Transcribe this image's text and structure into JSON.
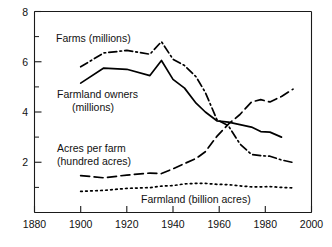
{
  "chart_data": {
    "type": "line",
    "title": "",
    "subtitle": "",
    "xlabel": "",
    "ylabel": "",
    "xlim": [
      1880,
      2000
    ],
    "ylim": [
      0,
      8
    ],
    "grid": false,
    "legend_position": "inline-annotations",
    "x_ticks": [
      1880,
      1900,
      1920,
      1940,
      1960,
      1980,
      2000
    ],
    "x_tick_labels": [
      "1880",
      "1900",
      "1920",
      "1940",
      "1960",
      "1980",
      "2000"
    ],
    "y_ticks": [
      2,
      4,
      6,
      8
    ],
    "y_tick_labels": [
      "2",
      "4",
      "6",
      "8"
    ],
    "y_minor_ticks": [
      1,
      3,
      5,
      7
    ],
    "series": [
      {
        "name": "Farms (millions)",
        "style": "dash-dot",
        "label_text": "Farms (millions)",
        "label_lines": [
          "Farms (millions)"
        ],
        "x": [
          1900,
          1910,
          1920,
          1930,
          1935,
          1940,
          1945,
          1950,
          1954,
          1959,
          1964,
          1969,
          1974,
          1978,
          1982,
          1987,
          1992
        ],
        "values": [
          5.8,
          6.35,
          6.45,
          6.3,
          6.8,
          6.1,
          5.85,
          5.4,
          4.78,
          3.7,
          3.45,
          2.73,
          2.31,
          2.26,
          2.24,
          2.09,
          1.99
        ]
      },
      {
        "name": "Farmland owners (millions)",
        "style": "solid",
        "label_text": "Farmland owners (millions)",
        "label_lines": [
          "Farmland owners",
          "(millions)"
        ],
        "x": [
          1900,
          1910,
          1920,
          1930,
          1935,
          1940,
          1945,
          1950,
          1954,
          1959,
          1964,
          1969,
          1974,
          1978,
          1982,
          1987
        ],
        "values": [
          5.15,
          5.75,
          5.7,
          5.45,
          6.05,
          5.3,
          4.95,
          4.35,
          4.0,
          3.65,
          3.6,
          3.5,
          3.4,
          3.22,
          3.2,
          3.0
        ]
      },
      {
        "name": "Acres per farm (hundred acres)",
        "style": "long-dash",
        "label_text": "Acres per farm (hundred acres)",
        "label_lines": [
          "Acres per farm",
          "(hundred acres)"
        ],
        "x": [
          1900,
          1910,
          1920,
          1930,
          1935,
          1940,
          1945,
          1950,
          1954,
          1959,
          1964,
          1969,
          1974,
          1978,
          1982,
          1987,
          1992
        ],
        "values": [
          1.47,
          1.38,
          1.49,
          1.57,
          1.55,
          1.74,
          1.95,
          2.15,
          2.42,
          3.03,
          3.52,
          3.9,
          4.4,
          4.49,
          4.4,
          4.62,
          4.91
        ]
      },
      {
        "name": "Farmland (billion acres)",
        "style": "dotted",
        "label_text": "Farmland (billion acres)",
        "label_lines": [
          "Farmland (billion acres)"
        ],
        "x": [
          1900,
          1910,
          1920,
          1930,
          1935,
          1940,
          1945,
          1950,
          1954,
          1959,
          1964,
          1969,
          1974,
          1978,
          1982,
          1987,
          1992
        ],
        "values": [
          0.84,
          0.88,
          0.96,
          0.99,
          1.05,
          1.07,
          1.14,
          1.16,
          1.16,
          1.12,
          1.11,
          1.06,
          1.02,
          1.02,
          1.03,
          1.0,
          0.98
        ]
      }
    ],
    "annotations": [
      {
        "id": "farms",
        "text": "Farms (millions)"
      },
      {
        "id": "farmland-owners",
        "text": "Farmland owners (millions)"
      },
      {
        "id": "acres-per-farm",
        "text": "Acres per farm (hundred acres)"
      },
      {
        "id": "farmland",
        "text": "Farmland (billion acres)"
      }
    ],
    "colors": {
      "ink": "#000000",
      "axis": "#1a1a1a",
      "background": "#ffffff"
    }
  },
  "axis": {
    "x_labels": {
      "t0": "1880",
      "t1": "1900",
      "t2": "1920",
      "t3": "1940",
      "t4": "1960",
      "t5": "1980",
      "t6": "2000"
    },
    "y_labels": {
      "t2": "2",
      "t4": "4",
      "t6": "6",
      "t8": "8"
    }
  },
  "labels": {
    "farms_l1": "Farms (millions)",
    "owners_l1": "Farmland owners",
    "owners_l2": "(millions)",
    "acres_l1": "Acres per farm",
    "acres_l2": "(hundred acres)",
    "farmland_l1": "Farmland (billion acres)"
  }
}
